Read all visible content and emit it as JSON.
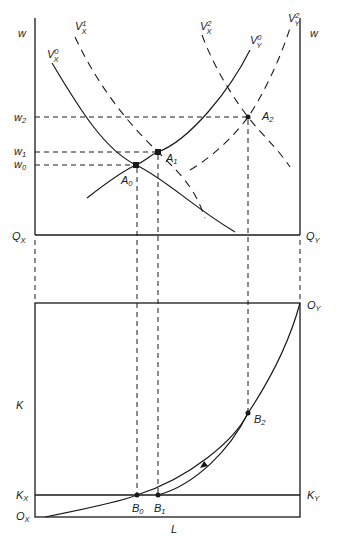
{
  "top_panel": {
    "y_axis_left_label": "w",
    "y_axis_right_label": "w",
    "origin_left": {
      "main": "Q",
      "sub": "X"
    },
    "origin_right": {
      "main": "Q",
      "sub": "Y"
    },
    "wage_levels": [
      {
        "main": "w",
        "sub": "2"
      },
      {
        "main": "w",
        "sub": "1"
      },
      {
        "main": "w",
        "sub": "0"
      }
    ],
    "curves": [
      {
        "main": "V",
        "sup": "0",
        "sub": "X",
        "style": "solid"
      },
      {
        "main": "V",
        "sup": "1",
        "sub": "X",
        "style": "dashed"
      },
      {
        "main": "V",
        "sup": "2",
        "sub": "X",
        "style": "dashed"
      },
      {
        "main": "V",
        "sup": "0",
        "sub": "Y",
        "style": "solid"
      },
      {
        "main": "V",
        "sup": "2",
        "sub": "Y",
        "style": "dashed"
      }
    ],
    "points": [
      {
        "main": "A",
        "sub": "0"
      },
      {
        "main": "A",
        "sub": "1"
      },
      {
        "main": "A",
        "sub": "2"
      }
    ]
  },
  "bottom_panel": {
    "y_axis_label": "K",
    "x_axis_label": "L",
    "origin_bottom_left": {
      "main": "O",
      "sub": "X"
    },
    "origin_top_right": {
      "main": "O",
      "sub": "Y"
    },
    "endowment_left": {
      "main": "K",
      "sub": "X"
    },
    "endowment_right": {
      "main": "K",
      "sub": "Y"
    },
    "points": [
      {
        "main": "B",
        "sub": "0"
      },
      {
        "main": "B",
        "sub": "1"
      },
      {
        "main": "B",
        "sub": "2"
      }
    ],
    "curves": [
      "contract curve (solid)",
      "adjustment path with arrow from B1 to B2"
    ]
  }
}
